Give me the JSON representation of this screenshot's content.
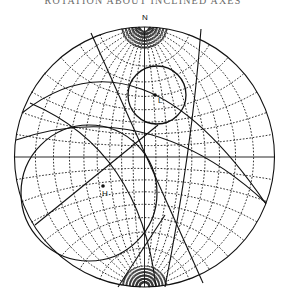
{
  "figure": {
    "title": "ROTATION ABOUT INCLINED AXES",
    "net_type": "Wulff stereographic net",
    "north_label": "N",
    "grid_interval_deg": 10,
    "points": [
      {
        "id": "L",
        "label": "L"
      },
      {
        "id": "H",
        "label": "H"
      }
    ],
    "colors": {
      "ink": "#111111",
      "grid": "#333333",
      "background": "#ffffff"
    }
  }
}
